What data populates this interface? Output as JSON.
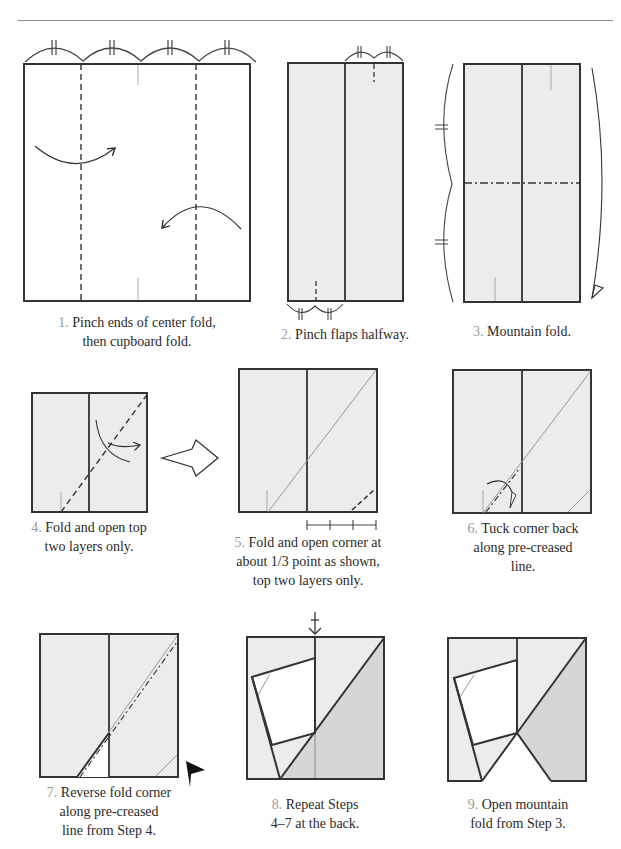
{
  "colors": {
    "paper_gray": "#ececec",
    "shade_gray": "#d6d6d6",
    "line": "#333333",
    "crease": "#9a9a9a",
    "step_num": "#9a9a9a"
  },
  "steps": [
    {
      "num": "1.",
      "text_l1": "Pinch ends of center fold,",
      "text_l2": "then cupboard fold."
    },
    {
      "num": "2.",
      "text_l1": "Pinch flaps halfway.",
      "text_l2": ""
    },
    {
      "num": "3.",
      "text_l1": "Mountain fold.",
      "text_l2": ""
    },
    {
      "num": "4.",
      "text_l1": "Fold and open top",
      "text_l2": "two layers only."
    },
    {
      "num": "5.",
      "text_l1": "Fold and open corner at",
      "text_l2": "about 1/3 point as shown,",
      "text_l3": "top two layers only."
    },
    {
      "num": "6.",
      "text_l1": "Tuck corner back",
      "text_l2": "along pre-creased",
      "text_l3": "line."
    },
    {
      "num": "7.",
      "text_l1": "Reverse fold corner",
      "text_l2": "along pre-creased",
      "text_l3": "line from Step 4."
    },
    {
      "num": "8.",
      "text_l1": "Repeat Steps",
      "text_l2": "4–7 at the back."
    },
    {
      "num": "9.",
      "text_l1": "Open mountain",
      "text_l2": "fold from Step 3."
    }
  ],
  "symbols": {
    "equal_marks": "equal-length-marks",
    "transition_arrow": "hollow-right-arrow",
    "reverse_fold_marker": "black-arrowhead",
    "turn_over_marker": "push-arrow"
  }
}
